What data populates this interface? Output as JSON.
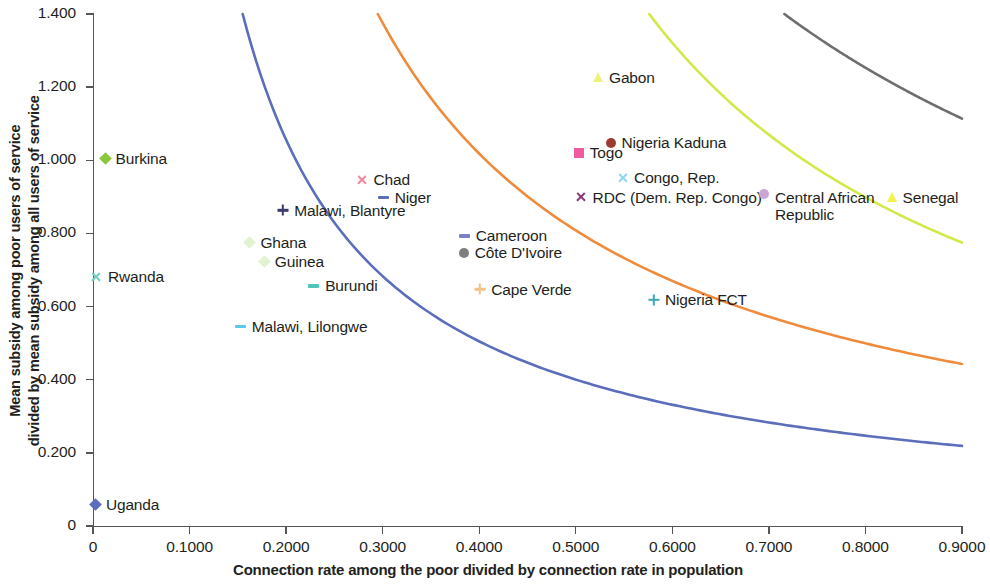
{
  "chart_data": {
    "type": "scatter",
    "title": "",
    "xlabel": "Connection rate among the poor divided by connection rate in population",
    "ylabel_line1": "Mean subsidy among poor users of service",
    "ylabel_line2": "divided by mean subsidy among all users of service",
    "xlim": [
      0,
      0.9
    ],
    "ylim": [
      0,
      1.4
    ],
    "grid": false,
    "legend_position": "none-inline-labels",
    "x_ticks": [
      "0",
      "0.1000",
      "0.2000",
      "0.3000",
      "0.4000",
      "0.5000",
      "0.6000",
      "0.7000",
      "0.8000",
      "0.9000"
    ],
    "x_tick_values": [
      0,
      0.1,
      0.2,
      0.3,
      0.4,
      0.5,
      0.6,
      0.7,
      0.8,
      0.9
    ],
    "y_ticks": [
      "0",
      "0.200",
      "0.400",
      "0.600",
      "0.800",
      "1.000",
      "1.200",
      "1.400"
    ],
    "y_tick_values": [
      0,
      0.2,
      0.4,
      0.6,
      0.8,
      1.0,
      1.2,
      1.4
    ],
    "points": [
      {
        "name": "Burkina",
        "x": 0.013,
        "y": 1.003,
        "marker": "diamond",
        "color": "#8cc63f",
        "label_side": "right"
      },
      {
        "name": "Rwanda",
        "x": 0.003,
        "y": 0.68,
        "marker": "ex",
        "color": "#6fcfc0",
        "label_side": "right"
      },
      {
        "name": "Uganda",
        "x": 0.003,
        "y": 0.057,
        "marker": "diamond",
        "color": "#5b6dbb",
        "label_side": "right"
      },
      {
        "name": "Malawi, Lilongwe",
        "x": 0.152,
        "y": 0.545,
        "marker": "dash",
        "color": "#5bc8e8",
        "label_side": "right"
      },
      {
        "name": "Ghana",
        "x": 0.163,
        "y": 0.775,
        "marker": "diamond",
        "color": "#e3f2d0",
        "label_side": "right"
      },
      {
        "name": "Guinea",
        "x": 0.178,
        "y": 0.722,
        "marker": "diamond",
        "color": "#e3f2d0",
        "label_side": "right"
      },
      {
        "name": "Malawi, Blantyre",
        "x": 0.196,
        "y": 0.862,
        "marker": "plus",
        "color": "#3b3b6b",
        "label_side": "right"
      },
      {
        "name": "Burundi",
        "x": 0.228,
        "y": 0.655,
        "marker": "dash",
        "color": "#4dc8b8",
        "label_side": "right"
      },
      {
        "name": "Chad",
        "x": 0.278,
        "y": 0.945,
        "marker": "ex",
        "color": "#f2889e",
        "label_side": "right"
      },
      {
        "name": "Niger",
        "x": 0.3,
        "y": 0.898,
        "marker": "dash",
        "color": "#5b6dbb",
        "label_side": "right"
      },
      {
        "name": "Cameroon",
        "x": 0.384,
        "y": 0.792,
        "marker": "dash",
        "color": "#7b7fc4",
        "label_side": "right"
      },
      {
        "name": "Côte D'Ivoire",
        "x": 0.384,
        "y": 0.746,
        "marker": "circle",
        "color": "#7e7e7e",
        "label_side": "right"
      },
      {
        "name": "Cape Verde",
        "x": 0.4,
        "y": 0.646,
        "marker": "plus",
        "color": "#f5c28a",
        "label_side": "right"
      },
      {
        "name": "Togo",
        "x": 0.503,
        "y": 1.02,
        "marker": "square",
        "color": "#ef5ba1",
        "label_side": "right"
      },
      {
        "name": "Nigeria Kaduna",
        "x": 0.536,
        "y": 1.046,
        "marker": "circle",
        "color": "#9e3b30",
        "label_side": "right"
      },
      {
        "name": "Congo, Rep.",
        "x": 0.548,
        "y": 0.952,
        "marker": "ex",
        "color": "#8fd6f0",
        "label_side": "right"
      },
      {
        "name": "RDC (Dem. Rep. Congo)",
        "x": 0.505,
        "y": 0.898,
        "marker": "ex",
        "color": "#8b3a7a",
        "label_side": "right"
      },
      {
        "name": "Gabon",
        "x": 0.523,
        "y": 1.226,
        "marker": "tri",
        "color": "#eef27a",
        "label_side": "right"
      },
      {
        "name": "Nigeria  FCT",
        "x": 0.58,
        "y": 0.617,
        "marker": "plus",
        "color": "#3da6b8",
        "label_side": "right"
      },
      {
        "name": "Central African Republic",
        "x": 0.695,
        "y": 0.898,
        "marker": "circle",
        "color": "#c9a6d6",
        "label_side": "right"
      },
      {
        "name": "Senegal",
        "x": 0.827,
        "y": 0.898,
        "marker": "tri",
        "color": "#f2f24a",
        "label_side": "right"
      }
    ],
    "curves": [
      {
        "name": "blue-isoline",
        "color": "#5b6dbb",
        "x_start": 0.155,
        "y_start": 1.4,
        "x_end": 0.9,
        "y_end": 0.219
      },
      {
        "name": "orange-isoline",
        "color": "#ef8b3c",
        "x_start": 0.295,
        "y_start": 1.4,
        "x_end": 0.9,
        "y_end": 0.443
      },
      {
        "name": "green-isoline",
        "color": "#d4e84a",
        "x_start": 0.576,
        "y_start": 1.4,
        "x_end": 0.9,
        "y_end": 0.775
      },
      {
        "name": "gray-isoline",
        "color": "#6e6e6e",
        "x_start": 0.716,
        "y_start": 1.4,
        "x_end": 0.9,
        "y_end": 1.114
      }
    ]
  }
}
